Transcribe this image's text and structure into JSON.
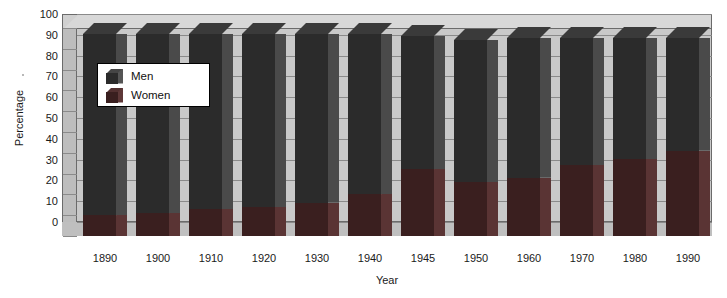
{
  "chart_data": {
    "type": "bar",
    "subtype": "stacked-3d-column",
    "title": "",
    "xlabel": "Year",
    "ylabel": "Percentage",
    "ylim": [
      0,
      100
    ],
    "ytick_step": 10,
    "yticks": [
      100,
      90,
      80,
      70,
      60,
      50,
      40,
      30,
      20,
      10,
      0
    ],
    "grid": true,
    "legend_position": "inside-upper-left",
    "categories": [
      "1890",
      "1900",
      "1910",
      "1920",
      "1930",
      "1940",
      "1945",
      "1950",
      "1960",
      "1970",
      "1980",
      "1990"
    ],
    "series": [
      {
        "name": "Women",
        "color": "#3a1f1f",
        "values": [
          10,
          11,
          13,
          14,
          16,
          20,
          32,
          26,
          28,
          34,
          37,
          41
        ]
      },
      {
        "name": "Men",
        "color": "#2b2b2b",
        "values": [
          87,
          86,
          84,
          83,
          81,
          77,
          64,
          68,
          67,
          61,
          58,
          54
        ]
      }
    ],
    "totals": [
      97,
      97,
      97,
      97,
      97,
      97,
      96,
      94,
      95,
      95,
      95,
      95
    ]
  },
  "axes": {
    "y_title": "Percentage",
    "x_title": "Year",
    "y_tick_labels": [
      "100",
      "90",
      "80",
      "70",
      "60",
      "50",
      "40",
      "30",
      "20",
      "10",
      "0"
    ],
    "x_tick_labels": [
      "1890",
      "1900",
      "1910",
      "1920",
      "1930",
      "1940",
      "1945",
      "1950",
      "1960",
      "1970",
      "1980",
      "1990"
    ]
  },
  "legend": {
    "items": [
      {
        "label": "Men",
        "color": "#2b2b2b"
      },
      {
        "label": "Women",
        "color": "#3a1f1f"
      }
    ]
  }
}
